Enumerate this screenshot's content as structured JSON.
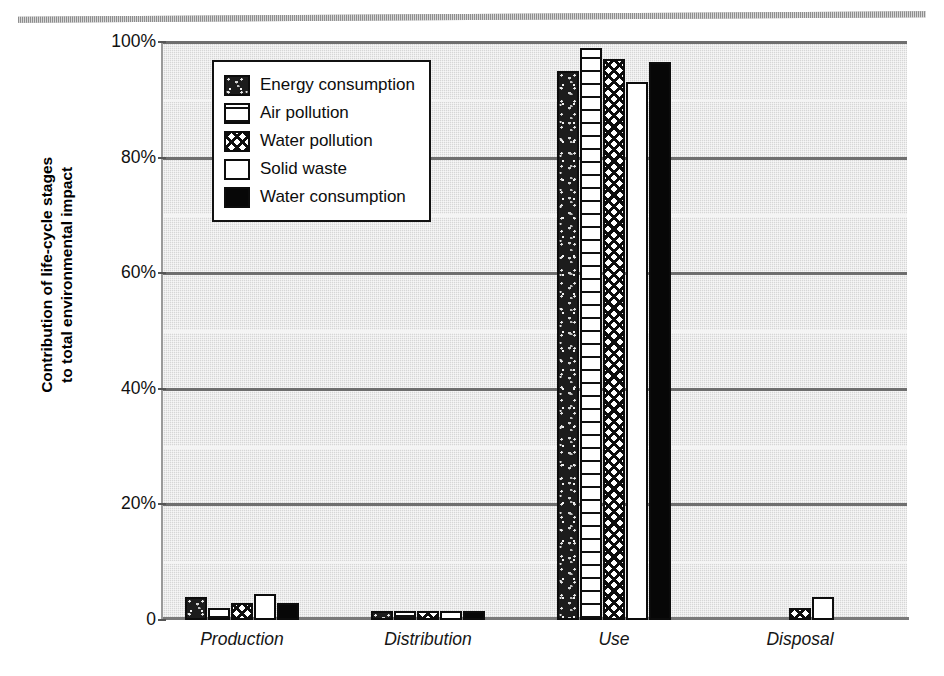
{
  "top_rule": {
    "cut_text": "ggg     y"
  },
  "chart_data": {
    "type": "bar",
    "title": "",
    "subtitle": "",
    "xlabel": "",
    "ylabel": "Contribution of life-cycle stages to total environmental impact",
    "ylabel_lines": [
      "Contribution of life-cycle stages",
      "to total environmental impact"
    ],
    "categories": [
      "Production",
      "Distribution",
      "Use",
      "Disposal"
    ],
    "ylim": [
      0,
      100
    ],
    "yticks": [
      0,
      20,
      40,
      60,
      80,
      100
    ],
    "ytick_labels": [
      "0",
      "20%",
      "40%",
      "60%",
      "80%",
      "100%"
    ],
    "grid": true,
    "grid_major_step": 20,
    "grid_minor_step": 10,
    "legend_position": "top-left-inside",
    "series": [
      {
        "name": "Energy consumption",
        "pattern": "pat-energy",
        "values": [
          4.0,
          1.5,
          95.0,
          0.0
        ]
      },
      {
        "name": "Air pollution",
        "pattern": "pat-air",
        "values": [
          2.0,
          1.5,
          99.0,
          0.0
        ]
      },
      {
        "name": "Water pollution",
        "pattern": "pat-waterpol",
        "values": [
          3.0,
          1.5,
          97.0,
          2.0
        ]
      },
      {
        "name": "Solid waste",
        "pattern": "pat-solid",
        "values": [
          4.5,
          1.5,
          93.0,
          4.0
        ]
      },
      {
        "name": "Water consumption",
        "pattern": "pat-waterconsum",
        "values": [
          3.0,
          1.5,
          96.5,
          0.0
        ]
      }
    ]
  },
  "legend": {
    "items": [
      {
        "label": "Energy consumption",
        "pattern": "pat-energy"
      },
      {
        "label": "Air pollution",
        "pattern": "pat-air"
      },
      {
        "label": "Water pollution",
        "pattern": "pat-waterpol"
      },
      {
        "label": "Solid waste",
        "pattern": "pat-solid"
      },
      {
        "label": "Water consumption",
        "pattern": "pat-waterconsum"
      }
    ]
  },
  "colors": {
    "plot_background": "#d6d6d6",
    "grid_major": "#6e6e6e",
    "grid_minor": "#f4f4f4",
    "bar_outline": "#0c0c0c",
    "text": "#111111"
  }
}
